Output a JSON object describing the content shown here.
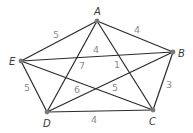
{
  "diagram": {
    "type": "weighted-complete-graph",
    "vertices": [
      {
        "id": "A",
        "label": "A",
        "x": 97,
        "y": 21,
        "lx": 94,
        "ly": 15
      },
      {
        "id": "B",
        "label": "B",
        "x": 173,
        "y": 52,
        "lx": 178,
        "ly": 57
      },
      {
        "id": "C",
        "label": "C",
        "x": 153,
        "y": 110,
        "lx": 149,
        "ly": 125
      },
      {
        "id": "D",
        "label": "D",
        "x": 47,
        "y": 112,
        "lx": 43,
        "ly": 127
      },
      {
        "id": "E",
        "label": "E",
        "x": 21,
        "y": 61,
        "lx": 9,
        "ly": 65
      }
    ],
    "edges": [
      {
        "from": "A",
        "to": "E",
        "weight": "5",
        "lx": 53,
        "ly": 38
      },
      {
        "from": "A",
        "to": "B",
        "weight": "4",
        "lx": 134,
        "ly": 33
      },
      {
        "from": "E",
        "to": "B",
        "weight": "4",
        "lx": 93,
        "ly": 53
      },
      {
        "from": "A",
        "to": "D",
        "weight": "7",
        "lx": 79,
        "ly": 69
      },
      {
        "from": "A",
        "to": "C",
        "weight": "1",
        "lx": 114,
        "ly": 68
      },
      {
        "from": "B",
        "to": "C",
        "weight": "3",
        "lx": 166,
        "ly": 88
      },
      {
        "from": "E",
        "to": "D",
        "weight": "5",
        "lx": 24,
        "ly": 91
      },
      {
        "from": "D",
        "to": "C",
        "weight": "4",
        "lx": 91,
        "ly": 123
      },
      {
        "from": "E",
        "to": "C",
        "weight": "5",
        "lx": 112,
        "ly": 91
      },
      {
        "from": "D",
        "to": "B",
        "weight": "6",
        "lx": 74,
        "ly": 93
      }
    ],
    "colors": {
      "edge": "#2b2b2b",
      "vertex": "#7a7a7a",
      "vertex_label": "#3a3a3a",
      "weight_label": "#8a8a8a",
      "background": "#ffffff"
    }
  }
}
